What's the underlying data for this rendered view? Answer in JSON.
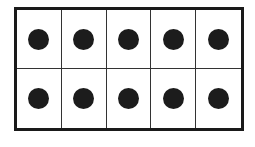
{
  "diagram": {
    "type": "ten-frame",
    "rows": 2,
    "columns": 5,
    "filled_count": 10,
    "cells": [
      {
        "filled": true
      },
      {
        "filled": true
      },
      {
        "filled": true
      },
      {
        "filled": true
      },
      {
        "filled": true
      },
      {
        "filled": true
      },
      {
        "filled": true
      },
      {
        "filled": true
      },
      {
        "filled": true
      },
      {
        "filled": true
      }
    ],
    "colors": {
      "dot": "#1c1c1c",
      "border": "#1a1a1a",
      "background": "#ffffff"
    }
  }
}
